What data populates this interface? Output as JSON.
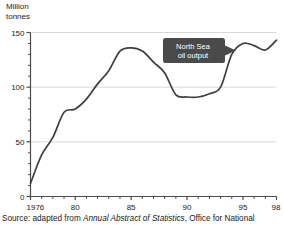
{
  "figure": {
    "y_axis_title": "Million\ntonnes",
    "source_prefix": "Source: adapted from ",
    "source_italic": "Annual Abstract of Statistics",
    "source_suffix": ", Office for National",
    "callout": {
      "line1": "North Sea",
      "line2": "oil output",
      "background": "#4a4a4a",
      "text_color": "#ffffff"
    },
    "colors": {
      "line": "#3f3f3f",
      "axis": "#4d4d4d",
      "grid": "#d9d9d9",
      "background": "#ffffff"
    }
  },
  "chart_data": {
    "type": "line",
    "title": "",
    "xlabel": "",
    "ylabel": "Million tonnes",
    "ylim": [
      0,
      150
    ],
    "xlim": [
      1976,
      1998
    ],
    "yticks": [
      0,
      50,
      100,
      150
    ],
    "ytick_labels": [
      "0",
      "50",
      "100",
      "150"
    ],
    "y_minor_tick_step": 10,
    "xticks": [
      1976,
      1980,
      1985,
      1990,
      1995,
      1998
    ],
    "xtick_labels": [
      "1976",
      "80",
      "85",
      "90",
      "95",
      "98"
    ],
    "x_minor_tick_step": 1,
    "grid": "horizontal-major",
    "legend": "none",
    "annotations": [
      {
        "text": "North Sea oil output",
        "points_to": 1993,
        "style": "callout-box"
      }
    ],
    "series": [
      {
        "name": "North Sea oil output",
        "x": [
          1976,
          1977,
          1978,
          1979,
          1980,
          1981,
          1982,
          1983,
          1984,
          1985,
          1986,
          1987,
          1988,
          1989,
          1990,
          1991,
          1992,
          1993,
          1994,
          1995,
          1996,
          1997,
          1998
        ],
        "values": [
          12,
          38,
          54,
          77,
          80,
          89,
          103,
          115,
          133,
          136,
          133,
          123,
          113,
          93,
          91,
          91,
          94,
          100,
          130,
          140,
          138,
          134,
          143
        ]
      }
    ]
  }
}
